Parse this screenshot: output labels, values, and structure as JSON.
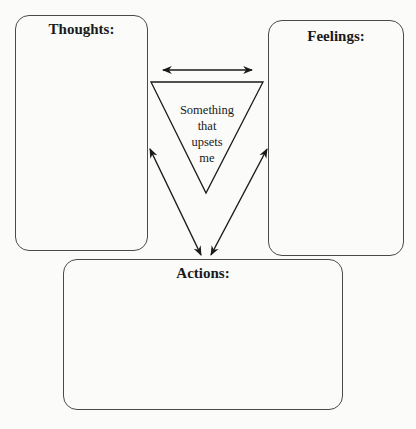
{
  "diagram": {
    "boxes": {
      "thoughts": {
        "label": "Thoughts:"
      },
      "feelings": {
        "label": "Feelings:"
      },
      "actions": {
        "label": "Actions:"
      }
    },
    "center": {
      "shape": "inverted-triangle",
      "lines": [
        "Something",
        "that",
        "upsets",
        "me"
      ]
    },
    "arrows": [
      {
        "name": "thoughts-feelings",
        "type": "double-headed",
        "orientation": "horizontal"
      },
      {
        "name": "thoughts-actions",
        "type": "double-headed",
        "orientation": "diagonal"
      },
      {
        "name": "feelings-actions",
        "type": "double-headed",
        "orientation": "diagonal"
      }
    ],
    "colors": {
      "stroke": "#1a1a1a",
      "box_border": "#4a4a4a",
      "background": "#fbfbfa"
    }
  }
}
